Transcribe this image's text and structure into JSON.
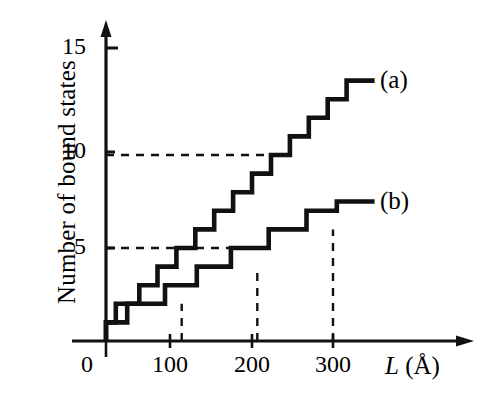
{
  "chart_data": {
    "type": "line",
    "subtype": "step",
    "title": "",
    "xlabel": "L (Å)",
    "xlabel_symbol": "L",
    "xlabel_unit": "(Å)",
    "ylabel": "Number of bound states",
    "xlim": [
      0,
      370
    ],
    "ylim": [
      0,
      16
    ],
    "xticks": [
      0,
      100,
      200,
      300
    ],
    "xticklabels": [
      "0",
      "100",
      "200",
      "300"
    ],
    "yticks": [
      5,
      10,
      15
    ],
    "yticklabels": [
      "5",
      "10",
      "15"
    ],
    "grid": false,
    "legend_position": "inline-right",
    "line_color": "#111111",
    "line_width": 4,
    "guide_color": "#111111",
    "annotations": [
      {
        "text": "(a)",
        "x": 352,
        "y": 13.9
      },
      {
        "text": "(b)",
        "x": 352,
        "y": 7.4
      }
    ],
    "guides": {
      "horizontal": [
        {
          "y": 10,
          "x_from": 0,
          "x_to": 228,
          "style": "dashed"
        },
        {
          "y": 5,
          "x_from": 0,
          "x_to": 200,
          "style": "dashed"
        }
      ],
      "vertical": [
        {
          "x": 100,
          "y_from": 0,
          "y_to": 2,
          "style": "dashed"
        },
        {
          "x": 200,
          "y_from": 0,
          "y_to": 4,
          "style": "dashed"
        },
        {
          "x": 300,
          "y_from": 0,
          "y_to": 6,
          "style": "dashed"
        }
      ]
    },
    "series": [
      {
        "name": "(a)",
        "label": "(a)",
        "step_width": 25,
        "steps": [
          {
            "x_start": 0,
            "x_end": 13,
            "value": 1
          },
          {
            "x_start": 13,
            "x_end": 25,
            "value": 2
          },
          {
            "x_start": 25,
            "x_end": 44,
            "value": 2
          },
          {
            "x_start": 44,
            "x_end": 68,
            "value": 3
          },
          {
            "x_start": 68,
            "x_end": 93,
            "value": 4
          },
          {
            "x_start": 93,
            "x_end": 118,
            "value": 5
          },
          {
            "x_start": 118,
            "x_end": 143,
            "value": 6
          },
          {
            "x_start": 143,
            "x_end": 168,
            "value": 7
          },
          {
            "x_start": 168,
            "x_end": 193,
            "value": 8
          },
          {
            "x_start": 193,
            "x_end": 218,
            "value": 9
          },
          {
            "x_start": 218,
            "x_end": 243,
            "value": 10
          },
          {
            "x_start": 243,
            "x_end": 268,
            "value": 11
          },
          {
            "x_start": 268,
            "x_end": 293,
            "value": 12
          },
          {
            "x_start": 293,
            "x_end": 318,
            "value": 13
          },
          {
            "x_start": 318,
            "x_end": 355,
            "value": 14
          }
        ]
      },
      {
        "name": "(b)",
        "label": "(b)",
        "step_width": 50,
        "steps": [
          {
            "x_start": 0,
            "x_end": 28,
            "value": 1
          },
          {
            "x_start": 28,
            "x_end": 78,
            "value": 2
          },
          {
            "x_start": 78,
            "x_end": 120,
            "value": 3
          },
          {
            "x_start": 120,
            "x_end": 165,
            "value": 4
          },
          {
            "x_start": 165,
            "x_end": 215,
            "value": 5
          },
          {
            "x_start": 215,
            "x_end": 265,
            "value": 6
          },
          {
            "x_start": 265,
            "x_end": 305,
            "value": 7
          },
          {
            "x_start": 305,
            "x_end": 355,
            "value": 7.5
          }
        ]
      }
    ]
  },
  "axes": {
    "y_title": "Number of bound states",
    "x_symbol": "L",
    "x_unit": "(Å)",
    "y_tick_15": "15",
    "y_tick_10": "10",
    "y_tick_5": "5",
    "x_tick_0": "0",
    "x_tick_100": "100",
    "x_tick_200": "200",
    "x_tick_300": "300"
  },
  "labels": {
    "curve_a": "(a)",
    "curve_b": "(b)"
  }
}
